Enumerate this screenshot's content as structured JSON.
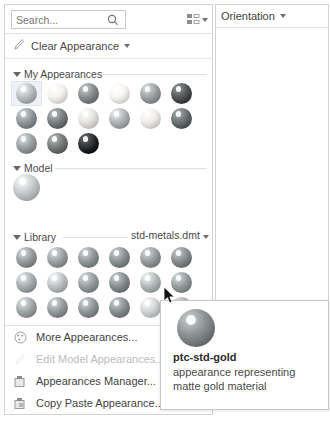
{
  "panel": {
    "search": {
      "placeholder": "Search...",
      "value": "",
      "icon": "search-icon"
    },
    "view_options": {
      "icon": "view-layout-icon",
      "caret": "chevron-down-icon"
    },
    "clear_appearance": {
      "label": "Clear Appearance",
      "icon": "brush-icon",
      "caret": "chevron-down-icon"
    },
    "sections": [
      {
        "id": "my-appearances",
        "label": "My Appearances",
        "expanded": true,
        "swatches": [
          {
            "index": 0,
            "color": "#b9bfc2",
            "selected": true
          },
          {
            "index": 1,
            "color": "#f4f3f0",
            "selected": false
          },
          {
            "index": 2,
            "color": "#8b8f90",
            "selected": false
          },
          {
            "index": 3,
            "color": "#f7f6f4",
            "selected": false
          },
          {
            "index": 4,
            "color": "#9fa4a6",
            "selected": false
          },
          {
            "index": 5,
            "color": "#565a5c",
            "selected": false
          },
          {
            "index": 6,
            "color": "#949a9d",
            "selected": false
          },
          {
            "index": 7,
            "color": "#7d8284",
            "selected": false
          },
          {
            "index": 8,
            "color": "#e6e5e2",
            "selected": false
          },
          {
            "index": 9,
            "color": "#b2b6b7",
            "selected": false
          },
          {
            "index": 10,
            "color": "#efeeeb",
            "selected": false
          },
          {
            "index": 11,
            "color": "#6e7375",
            "selected": false
          },
          {
            "index": 12,
            "color": "#9ea3a5",
            "selected": false
          },
          {
            "index": 13,
            "color": "#7a7f7e",
            "selected": false
          },
          {
            "index": 14,
            "color": "#2f3133",
            "selected": false
          }
        ]
      },
      {
        "id": "model",
        "label": "Model",
        "expanded": true,
        "swatches": [
          {
            "index": 0,
            "color": "#c9cdce",
            "selected": false
          }
        ]
      },
      {
        "id": "library",
        "label": "Library",
        "expanded": true,
        "file": "std-metals.dmt",
        "file_caret": "chevron-down-icon",
        "swatches": [
          {
            "index": 0,
            "color": "#9aa0a2",
            "selected": false
          },
          {
            "index": 1,
            "color": "#a0a5a7",
            "selected": false
          },
          {
            "index": 2,
            "color": "#959b9d",
            "selected": false
          },
          {
            "index": 3,
            "color": "#8f9597",
            "selected": false
          },
          {
            "index": 4,
            "color": "#9aa0a2",
            "selected": false
          },
          {
            "index": 5,
            "color": "#8b9092",
            "selected": false
          },
          {
            "index": 6,
            "color": "#abb0b2",
            "selected": false
          },
          {
            "index": 7,
            "color": "#c0c4c5",
            "selected": false
          },
          {
            "index": 8,
            "color": "#9ba1a3",
            "selected": false
          },
          {
            "index": 9,
            "color": "#8d9294",
            "selected": false
          },
          {
            "index": 10,
            "color": "#b6bbbc",
            "selected": false
          },
          {
            "index": 11,
            "color": "#9aa0a2",
            "selected": false
          },
          {
            "index": 12,
            "color": "#a5aaac",
            "selected": false
          },
          {
            "index": 13,
            "color": "#9aa0a2",
            "selected": false
          },
          {
            "index": 14,
            "color": "#959b9d",
            "selected": false
          },
          {
            "index": 15,
            "color": "#8f9597",
            "selected": false
          },
          {
            "index": 16,
            "color": "#d4d7d7",
            "selected": false
          },
          {
            "index": 17,
            "color": "#a8adaf",
            "selected": false
          }
        ]
      }
    ],
    "menu": [
      {
        "label": "More Appearances...",
        "icon": "palette-icon",
        "enabled": true
      },
      {
        "label": "Edit Model Appearances...",
        "icon": "edit-brush-icon",
        "enabled": false
      },
      {
        "label": "Appearances Manager...",
        "icon": "manager-icon",
        "enabled": true
      },
      {
        "label": "Copy Paste Appearance...",
        "icon": "copy-paste-icon",
        "enabled": true
      }
    ]
  },
  "orientation": {
    "label": "Orientation",
    "caret": "chevron-down-icon"
  },
  "tooltip": {
    "title": "ptc-std-gold",
    "description": "appearance representing matte gold material",
    "swatch_color": "#8d9294"
  },
  "cursor": {
    "icon": "mouse-pointer-icon"
  },
  "colors": {
    "panel_border": "#d2d2d2",
    "text": "#3f3f3f",
    "muted_text": "#7b7b7b",
    "disabled_text": "#bcbcbc",
    "selection_bg": "#eef2f6"
  }
}
